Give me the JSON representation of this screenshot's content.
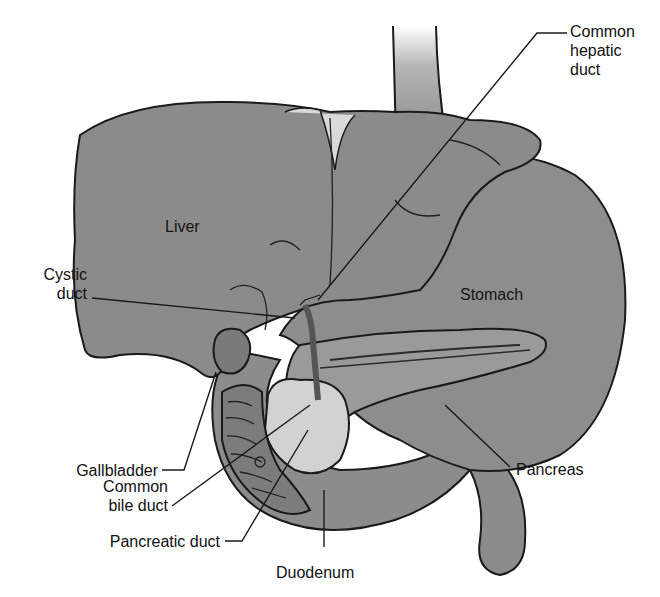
{
  "diagram": {
    "colors": {
      "organ_fill": "#8a8a8a",
      "organ_dark": "#6e6e6e",
      "pancreas_fill": "#cfcfcf",
      "outline": "#1a1a1a",
      "background": "#ffffff"
    },
    "labels": {
      "common_hepatic_duct": {
        "line1": "Common",
        "line2": "hepatic",
        "line3": "duct"
      },
      "liver": "Liver",
      "cystic_duct": {
        "line1": "Cystic",
        "line2": "duct"
      },
      "stomach": "Stomach",
      "gallbladder": "Gallbladder",
      "common_bile_duct": {
        "line1": "Common",
        "line2": "bile duct"
      },
      "pancreas": "Pancreas",
      "pancreatic_duct": "Pancreatic duct",
      "duodenum": "Duodenum"
    }
  }
}
